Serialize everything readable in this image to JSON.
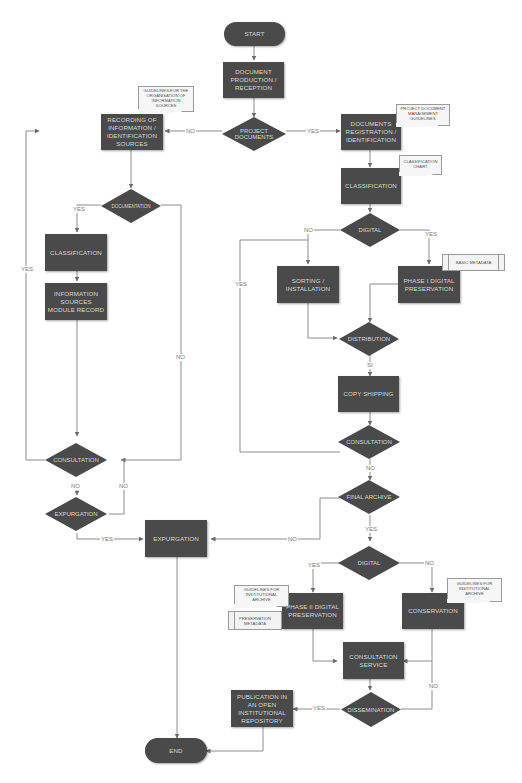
{
  "diagram": {
    "type": "flowchart",
    "colors": {
      "node_fill": "#4a4a4a",
      "node_text": "#d8d8d8",
      "connector": "#8c8c8c",
      "note_fill": "#f6f6f6",
      "background": "#ffffff"
    },
    "terminals": {
      "start": "START",
      "end": "END"
    },
    "process": {
      "document_production": "DOCUMENT PRODUCTION / RECEPTION",
      "recording_info": "RECORDING OF INFORMATION / IDENTIFICATION SOURCES",
      "documents_registration": "DOCUMENTS REGISTRATION / IDENTIFICATION",
      "classification_right": "CLASSIFICATION",
      "classification_left": "CLASSIFICATION",
      "info_sources_record": "INFORMATION SOURCES MODULE RECORD",
      "sorting_installation": "SORTING / INSTALLATION",
      "phase1_digital": "PHASE I DIGITAL PRESERVATION",
      "copy_shipping": "COPY SHIPPING",
      "expurgation_box": "EXPURGATION",
      "phase2_digital": "PHASE II DIGITAL PRESERVATION",
      "conservation": "CONSERVATION",
      "consultation_service": "CONSULTATION SERVICE",
      "publication_repository": "PUBLICATION IN AN OPEN INSTITUTIONAL REPOSITORY"
    },
    "decisions": {
      "project_documents": "PROJECT DOCUMENTS",
      "documentation": "DOCUMENTATION",
      "digital_top": "DIGITAL",
      "distribution": "DISTRIBUTION",
      "consultation_right": "CONSULTATION",
      "consultation_left": "CONSULTATION",
      "expurgation_decision": "EXPURGATION",
      "final_archive": "FINAL ARCHIVE",
      "digital_bottom": "DIGITAL",
      "dissemination": "DISSEMINATION"
    },
    "documents": {
      "guidelines_info_sources": "GUIDELINES FOR THE ORGANISATION OF INFORMATION SOURCES",
      "project_doc_guidelines": "PROJECT DOCUMENT MANAGEMENT GUIDELINES",
      "classification_chart": "CLASSIFICATION CHART",
      "guidelines_inst_archive_left": "GUIDELINES FOR INSTITUTIONAL ARCHIVE",
      "guidelines_inst_archive_right": "GUIDELINES FOR INSTITUTIONAL ARCHIVE"
    },
    "data_stores": {
      "basic_metadata": "BASIC METADATA",
      "preservation_metadata": "PRESERVATION METADATA"
    },
    "edge_labels": {
      "no_project": "NO",
      "yes_project": "YES",
      "yes_documentation": "YES",
      "yes_left_loop": "YES",
      "no_documentation": "NO",
      "no_digital_top": "NO",
      "yes_digital_top": "YES",
      "yes_right_loop": "YES",
      "si_distribution": "SI",
      "no_consultation_right": "NO",
      "no_consultation_left": "NO",
      "no_expurgation": "NO",
      "yes_expurgation": "YES",
      "no_final_archive": "NO",
      "yes_final_archive": "YES",
      "yes_digital_bottom": "YES",
      "no_digital_bottom": "NO",
      "no_dissemination": "NO",
      "yes_dissemination": "YES"
    }
  }
}
